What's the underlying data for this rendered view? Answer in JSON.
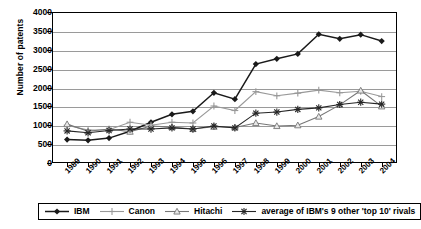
{
  "chart_data": {
    "type": "line",
    "title": "",
    "xlabel": "",
    "ylabel": "Number of patents",
    "ylim": [
      0,
      4000
    ],
    "ytick_step": 500,
    "yticks": [
      "0",
      "500",
      "1000",
      "1500",
      "2000",
      "2500",
      "3000",
      "3500",
      "4000"
    ],
    "grid": true,
    "legend_position": "bottom",
    "categories": [
      "1989",
      "1990",
      "1991",
      "1992",
      "1993",
      "1994",
      "1995",
      "1996",
      "1997",
      "1998",
      "1999",
      "2000",
      "2001",
      "2002",
      "2003",
      "2004"
    ],
    "series": [
      {
        "name": "IBM",
        "marker": "diamond",
        "color": "#1a1a1a",
        "values": [
          620,
          600,
          660,
          840,
          1080,
          1290,
          1370,
          1860,
          1690,
          2620,
          2760,
          2890,
          3410,
          3290,
          3400,
          3230
        ]
      },
      {
        "name": "Canon",
        "marker": "plus",
        "color": "#999999",
        "values": [
          1000,
          870,
          880,
          1080,
          1000,
          1080,
          1060,
          1510,
          1390,
          1890,
          1780,
          1850,
          1930,
          1860,
          1900,
          1760
        ]
      },
      {
        "name": "Hitachi",
        "marker": "triangle",
        "color": "#777777",
        "values": [
          1030,
          840,
          900,
          830,
          980,
          950,
          900,
          960,
          940,
          1060,
          980,
          1000,
          1230,
          1540,
          1920,
          1500
        ]
      },
      {
        "name": "average of IBM's 9 other 'top 10' rivals",
        "marker": "asterisk",
        "color": "#262626",
        "values": [
          850,
          800,
          860,
          900,
          900,
          930,
          900,
          980,
          930,
          1320,
          1350,
          1420,
          1460,
          1550,
          1610,
          1560
        ]
      }
    ]
  },
  "axis": {
    "y_title": "Number of patents"
  },
  "legend": {
    "entries": [
      {
        "label": "IBM"
      },
      {
        "label": "Canon"
      },
      {
        "label": "Hitachi"
      },
      {
        "label": "average of IBM's 9 other 'top 10' rivals"
      }
    ]
  }
}
